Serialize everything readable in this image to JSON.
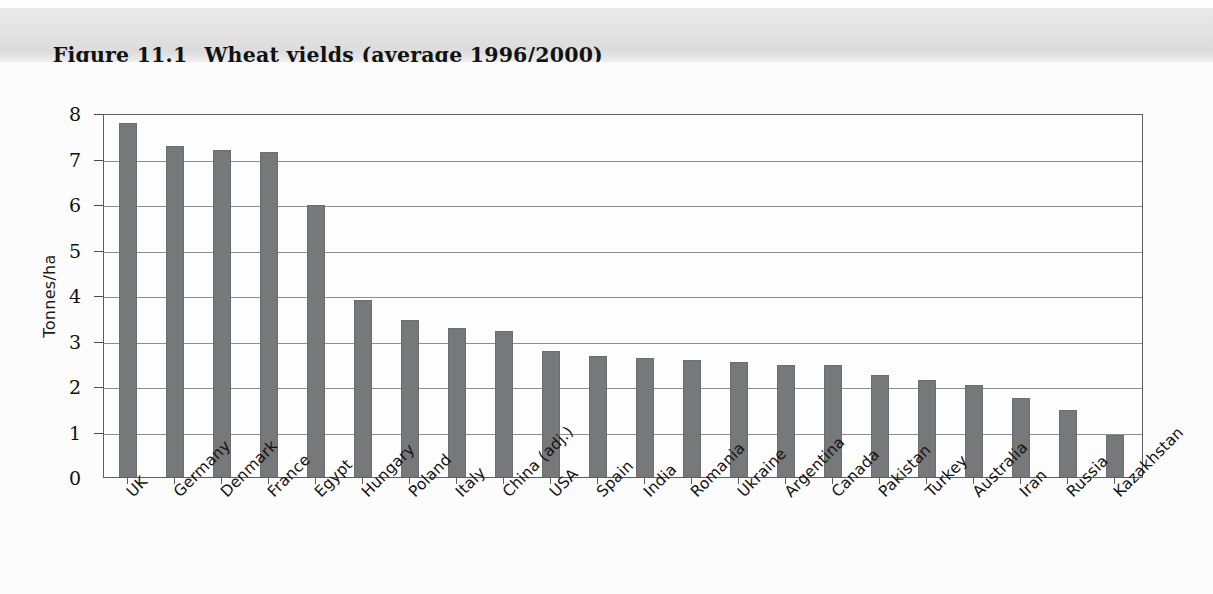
{
  "header": {
    "figure_number": "Figure 11.1",
    "title": "Wheat yields (average 1996/2000)",
    "band_color": "#e3e3e3"
  },
  "chart_data": {
    "type": "bar",
    "title": "Wheat yields (average 1996/2000)",
    "xlabel": "",
    "ylabel": "Tonnes/ha",
    "ylim": [
      0,
      8
    ],
    "yticks": [
      0,
      1,
      2,
      3,
      4,
      5,
      6,
      7,
      8
    ],
    "ytick_labels": [
      "0",
      "1",
      "2",
      "3",
      "4",
      "5",
      "6",
      "7",
      "8"
    ],
    "grid": true,
    "legend": "none",
    "bar_color": "#77787a",
    "categories": [
      "UK",
      "Germany",
      "Denmark",
      "France",
      "Egypt",
      "Hungary",
      "Poland",
      "Italy",
      "China (adj.)",
      "USA",
      "Spain",
      "India",
      "Romania",
      "Ukraine",
      "Argentina",
      "Canada",
      "Pakistan",
      "Turkey",
      "Australia",
      "Iran",
      "Russia",
      "Kazakhstan"
    ],
    "values": [
      7.78,
      7.27,
      7.19,
      7.14,
      5.98,
      3.88,
      3.46,
      3.27,
      3.2,
      2.78,
      2.67,
      2.62,
      2.57,
      2.52,
      2.47,
      2.47,
      2.24,
      2.13,
      2.02,
      1.74,
      1.48,
      0.92
    ]
  }
}
